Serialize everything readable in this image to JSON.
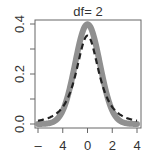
{
  "chart_data": {
    "type": "line",
    "title": "df= 2",
    "xlabel": "",
    "ylabel": "",
    "xlim": [
      -4.2,
      4.2
    ],
    "ylim": [
      0.0,
      0.41
    ],
    "x_ticks": [
      -4,
      -2,
      0,
      2,
      4
    ],
    "x_tick_labels": [
      "–",
      "4",
      "0",
      "2",
      "4"
    ],
    "y_ticks": [
      0.0,
      0.1,
      0.2,
      0.3,
      0.4
    ],
    "y_tick_labels": [
      "0.0",
      "",
      "0.2",
      "",
      "0.4"
    ],
    "grid": false,
    "legend": null,
    "series": [
      {
        "name": "standard normal density",
        "style": "solid-thick",
        "color": "#909090",
        "x": [
          -4,
          -3.5,
          -3,
          -2.5,
          -2,
          -1.5,
          -1,
          -0.5,
          0,
          0.5,
          1,
          1.5,
          2,
          2.5,
          3,
          3.5,
          4
        ],
        "values": [
          0.0001,
          0.0009,
          0.0044,
          0.0175,
          0.054,
          0.1295,
          0.242,
          0.3521,
          0.3989,
          0.3521,
          0.242,
          0.1295,
          0.054,
          0.0175,
          0.0044,
          0.0009,
          0.0001
        ]
      },
      {
        "name": "t density df=2",
        "style": "dashed",
        "color": "#222222",
        "x": [
          -4,
          -3.5,
          -3,
          -2.5,
          -2,
          -1.5,
          -1,
          -0.5,
          0,
          0.5,
          1,
          1.5,
          2,
          2.5,
          3,
          3.5,
          4
        ],
        "values": [
          0.0131,
          0.0185,
          0.0275,
          0.0422,
          0.068,
          0.1136,
          0.1925,
          0.2962,
          0.3536,
          0.2962,
          0.1925,
          0.1136,
          0.068,
          0.0422,
          0.0275,
          0.0185,
          0.0131
        ]
      }
    ]
  }
}
